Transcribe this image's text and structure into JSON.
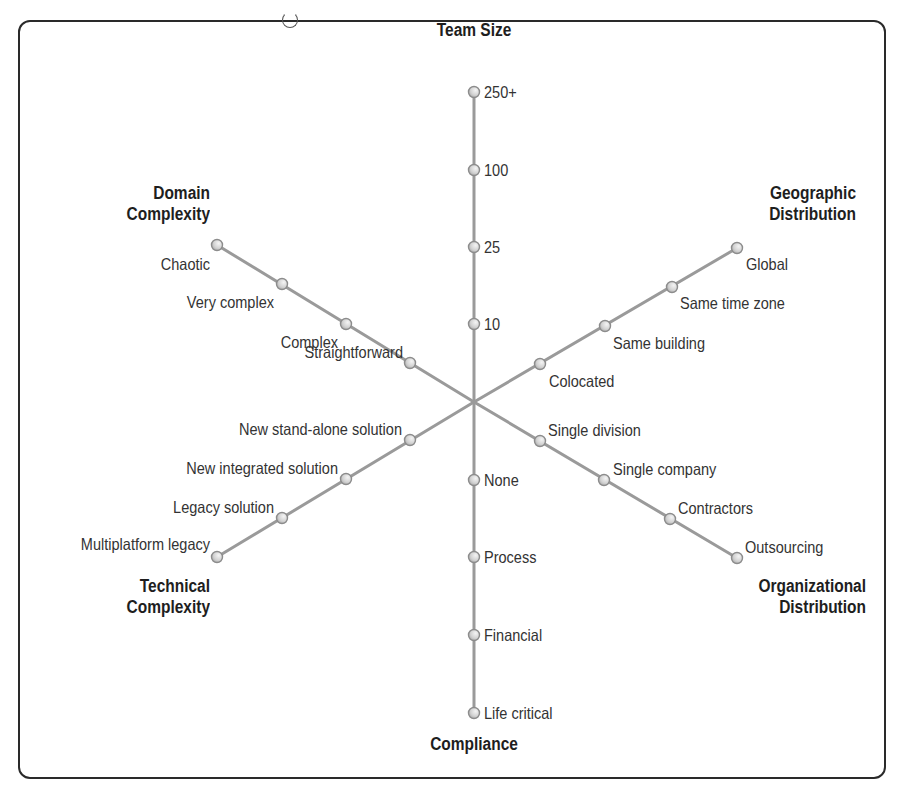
{
  "diagram": {
    "center": {
      "x": 474,
      "y": 402
    },
    "colors": {
      "frame": "#2a2a2a",
      "axis_line": "#9a9a9a",
      "node_fill": "#d9d9d9",
      "node_stroke": "#8c8c8c",
      "title_text": "#1e1e1e",
      "label_text": "#333333"
    },
    "axes": [
      {
        "id": "team-size",
        "title": "Team Size",
        "title_lines": [
          "Team Size"
        ],
        "end": {
          "x": 474,
          "y": 92
        },
        "nodes": [
          {
            "label": "10",
            "x": 474,
            "y": 324
          },
          {
            "label": "25",
            "x": 474,
            "y": 247
          },
          {
            "label": "100",
            "x": 474,
            "y": 170
          },
          {
            "label": "250+",
            "x": 474,
            "y": 92
          }
        ]
      },
      {
        "id": "geographic-distribution",
        "title": "Geographic Distribution",
        "title_lines": [
          "Geographic",
          "Distribution"
        ],
        "end": {
          "x": 737,
          "y": 248
        },
        "nodes": [
          {
            "label": "Colocated",
            "x": 540,
            "y": 364
          },
          {
            "label": "Same building",
            "x": 605,
            "y": 326
          },
          {
            "label": "Same time zone",
            "x": 672,
            "y": 287
          },
          {
            "label": "Global",
            "x": 737,
            "y": 248
          }
        ]
      },
      {
        "id": "organizational-distribution",
        "title": "Organizational Distribution",
        "title_lines": [
          "Organizational",
          "Distribution"
        ],
        "end": {
          "x": 737,
          "y": 558
        },
        "nodes": [
          {
            "label": "Single division",
            "x": 540,
            "y": 441
          },
          {
            "label": "Single company",
            "x": 604,
            "y": 480
          },
          {
            "label": "Contractors",
            "x": 670,
            "y": 519
          },
          {
            "label": "Outsourcing",
            "x": 737,
            "y": 558
          }
        ]
      },
      {
        "id": "compliance",
        "title": "Compliance",
        "title_lines": [
          "Compliance"
        ],
        "end": {
          "x": 474,
          "y": 713
        },
        "nodes": [
          {
            "label": "None",
            "x": 474,
            "y": 480
          },
          {
            "label": "Process",
            "x": 474,
            "y": 557
          },
          {
            "label": "Financial",
            "x": 474,
            "y": 635
          },
          {
            "label": "Life critical",
            "x": 474,
            "y": 713
          }
        ]
      },
      {
        "id": "technical-complexity",
        "title": "Technical Complexity",
        "title_lines": [
          "Technical",
          "Complexity"
        ],
        "end": {
          "x": 217,
          "y": 557
        },
        "nodes": [
          {
            "label": "New stand-alone solution",
            "x": 410,
            "y": 440
          },
          {
            "label": "New integrated solution",
            "x": 346,
            "y": 479
          },
          {
            "label": "Legacy solution",
            "x": 282,
            "y": 518
          },
          {
            "label": "Multiplatform legacy",
            "x": 217,
            "y": 557
          }
        ]
      },
      {
        "id": "domain-complexity",
        "title": "Domain Complexity",
        "title_lines": [
          "Domain",
          "Complexity"
        ],
        "end": {
          "x": 217,
          "y": 245
        },
        "nodes": [
          {
            "label": "Straightforward",
            "x": 410,
            "y": 363
          },
          {
            "label": "Complex",
            "x": 346,
            "y": 324
          },
          {
            "label": "Very complex",
            "x": 282,
            "y": 284
          },
          {
            "label": "Chaotic",
            "x": 217,
            "y": 245
          }
        ]
      }
    ]
  }
}
